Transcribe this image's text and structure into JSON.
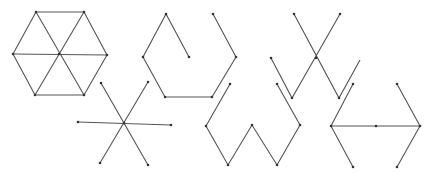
{
  "figure": {
    "stroke_color": "#555555",
    "vertex_color": "#333333",
    "graphs": [
      {
        "name": "hexagon-wheel",
        "paths": [
          [
            [
              36,
              12
            ],
            [
              84,
              12
            ],
            [
              107,
              55
            ],
            [
              84,
              95
            ],
            [
              35,
              95
            ],
            [
              13,
              54
            ],
            [
              36,
              12
            ]
          ],
          [
            [
              36,
              12
            ],
            [
              84,
              95
            ]
          ],
          [
            [
              84,
              12
            ],
            [
              35,
              95
            ]
          ],
          [
            [
              13,
              54
            ],
            [
              107,
              55
            ]
          ]
        ],
        "vertices": [
          [
            36,
            12
          ],
          [
            84,
            12
          ],
          [
            107,
            55
          ],
          [
            84,
            95
          ],
          [
            35,
            95
          ],
          [
            13,
            54
          ],
          [
            59,
            54
          ]
        ]
      },
      {
        "name": "open-hexagon-path",
        "paths": [
          [
            [
              189,
              57
            ],
            [
              166,
              14
            ],
            [
              143,
              57
            ],
            [
              165,
              97
            ],
            [
              212,
              97
            ],
            [
              236,
              57
            ],
            [
              213,
              14
            ]
          ]
        ],
        "vertices": [
          [
            189,
            57
          ],
          [
            166,
            14
          ],
          [
            143,
            57
          ],
          [
            165,
            97
          ],
          [
            212,
            97
          ],
          [
            236,
            57
          ],
          [
            213,
            14
          ]
        ]
      },
      {
        "name": "crossed-zigzag",
        "paths": [
          [
            [
              294,
              14
            ],
            [
              339,
              98
            ],
            [
              360,
              60
            ]
          ],
          [
            [
              340,
              14
            ],
            [
              292,
              98
            ],
            [
              271,
              58
            ]
          ]
        ],
        "vertices": [
          [
            294,
            14
          ],
          [
            340,
            14
          ],
          [
            316,
            58
          ],
          [
            271,
            58
          ],
          [
            292,
            98
          ],
          [
            339,
            98
          ]
        ]
      },
      {
        "name": "six-ray-star",
        "paths": [
          [
            [
              101,
              83
            ],
            [
              148,
              165
            ]
          ],
          [
            [
              148,
              82
            ],
            [
              100,
              163
            ]
          ],
          [
            [
              78,
              122
            ],
            [
              171,
              125
            ]
          ]
        ],
        "vertices": [
          [
            101,
            83
          ],
          [
            148,
            82
          ],
          [
            78,
            122
          ],
          [
            171,
            125
          ],
          [
            100,
            163
          ],
          [
            148,
            165
          ],
          [
            124,
            123
          ]
        ]
      },
      {
        "name": "w-zigzag",
        "paths": [
          [
            [
              230,
              84
            ],
            [
              206,
              126
            ],
            [
              228,
              165
            ],
            [
              252,
              125
            ],
            [
              277,
              165
            ],
            [
              300,
              125
            ],
            [
              277,
              84
            ]
          ]
        ],
        "vertices": [
          [
            230,
            84
          ],
          [
            206,
            126
          ],
          [
            228,
            165
          ],
          [
            252,
            125
          ],
          [
            277,
            165
          ],
          [
            300,
            125
          ],
          [
            277,
            84
          ]
        ]
      },
      {
        "name": "double-chevron",
        "paths": [
          [
            [
              353,
              84
            ],
            [
              331,
              126
            ],
            [
              353,
              167
            ]
          ],
          [
            [
              397,
              84
            ],
            [
              420,
              126
            ],
            [
              397,
              167
            ]
          ],
          [
            [
              331,
              126
            ],
            [
              420,
              126
            ]
          ]
        ],
        "vertices": [
          [
            353,
            84
          ],
          [
            331,
            126
          ],
          [
            353,
            167
          ],
          [
            397,
            84
          ],
          [
            420,
            126
          ],
          [
            397,
            167
          ],
          [
            376,
            126
          ]
        ]
      }
    ]
  }
}
